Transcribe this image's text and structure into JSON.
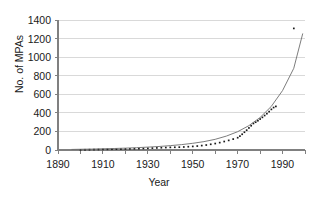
{
  "chart_data": {
    "type": "scatter",
    "title": "",
    "xlabel": "Year",
    "ylabel": "No. of MPAs",
    "xlim": [
      1890,
      2000
    ],
    "ylim": [
      0,
      1400
    ],
    "grid": true,
    "legend": false,
    "xticks": [
      1890,
      1910,
      1930,
      1950,
      1970,
      1990
    ],
    "yticks": [
      0,
      200,
      400,
      600,
      800,
      1000,
      1200,
      1400
    ],
    "series": [
      {
        "name": "Cumulative number of MPAs",
        "marker": "dot",
        "color": "#1a1a1a",
        "points": [
          [
            1900,
            2
          ],
          [
            1902,
            3
          ],
          [
            1904,
            4
          ],
          [
            1906,
            5
          ],
          [
            1908,
            6
          ],
          [
            1910,
            7
          ],
          [
            1912,
            8
          ],
          [
            1914,
            9
          ],
          [
            1916,
            10
          ],
          [
            1918,
            11
          ],
          [
            1920,
            12
          ],
          [
            1922,
            13
          ],
          [
            1924,
            14
          ],
          [
            1926,
            15
          ],
          [
            1928,
            17
          ],
          [
            1930,
            19
          ],
          [
            1932,
            21
          ],
          [
            1934,
            23
          ],
          [
            1936,
            25
          ],
          [
            1938,
            27
          ],
          [
            1940,
            29
          ],
          [
            1942,
            30
          ],
          [
            1944,
            31
          ],
          [
            1946,
            33
          ],
          [
            1948,
            36
          ],
          [
            1950,
            39
          ],
          [
            1952,
            43
          ],
          [
            1954,
            48
          ],
          [
            1956,
            54
          ],
          [
            1958,
            62
          ],
          [
            1960,
            70
          ],
          [
            1962,
            80
          ],
          [
            1964,
            92
          ],
          [
            1966,
            104
          ],
          [
            1968,
            118
          ],
          [
            1970,
            133
          ],
          [
            1971,
            150
          ],
          [
            1972,
            170
          ],
          [
            1973,
            192
          ],
          [
            1974,
            214
          ],
          [
            1975,
            238
          ],
          [
            1976,
            262
          ],
          [
            1977,
            286
          ],
          [
            1978,
            300
          ],
          [
            1979,
            316
          ],
          [
            1980,
            334
          ],
          [
            1981,
            352
          ],
          [
            1982,
            372
          ],
          [
            1983,
            392
          ],
          [
            1984,
            414
          ],
          [
            1985,
            438
          ],
          [
            1986,
            458
          ],
          [
            1987,
            470
          ]
        ]
      },
      {
        "name": "Fitted exponential curve",
        "marker": "line",
        "color": "#6e6e6e",
        "points": [
          [
            1896,
            6
          ],
          [
            1900,
            8
          ],
          [
            1905,
            10
          ],
          [
            1910,
            13
          ],
          [
            1915,
            16
          ],
          [
            1920,
            20
          ],
          [
            1925,
            25
          ],
          [
            1930,
            31
          ],
          [
            1935,
            38
          ],
          [
            1940,
            47
          ],
          [
            1945,
            58
          ],
          [
            1950,
            72
          ],
          [
            1955,
            90
          ],
          [
            1960,
            115
          ],
          [
            1965,
            150
          ],
          [
            1970,
            197
          ],
          [
            1975,
            262
          ],
          [
            1980,
            350
          ],
          [
            1985,
            470
          ],
          [
            1990,
            640
          ],
          [
            1995,
            880
          ],
          [
            1999,
            1255
          ]
        ]
      },
      {
        "name": "Outlier point",
        "marker": "dot",
        "color": "#1a1a1a",
        "points": [
          [
            1995,
            1310
          ]
        ]
      }
    ]
  },
  "axes": {
    "y_title": "No. of MPAs",
    "x_title": "Year",
    "y_tick_labels": [
      "1400",
      "1200",
      "1000",
      "800",
      "600",
      "400",
      "200",
      "0"
    ],
    "x_tick_labels": [
      "1890",
      "1910",
      "1930",
      "1950",
      "1970",
      "1990"
    ]
  },
  "colors": {
    "gridline": "#d9d9d9",
    "axis": "#808080",
    "data": "#1a1a1a",
    "curve": "#6e6e6e",
    "text": "#1a1a1a",
    "background": "#ffffff"
  }
}
